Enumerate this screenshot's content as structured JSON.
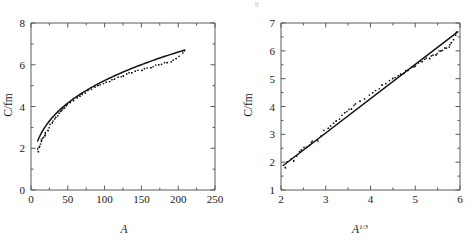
{
  "figure": {
    "panels": 2,
    "ink_color": "#111111",
    "axis_color": "#5a5a5a",
    "background": "#ffffff"
  },
  "chart_data": [
    {
      "type": "scatter",
      "panel": "left",
      "title": "",
      "xlabel": "A",
      "ylabel": "C/fm",
      "xlim": [
        0,
        250
      ],
      "ylim": [
        0,
        8
      ],
      "xticks": [
        0,
        50,
        100,
        150,
        200,
        250
      ],
      "yticks": [
        0,
        2,
        4,
        6,
        8
      ],
      "xtick_labels": [
        "0",
        "50",
        "100",
        "150",
        "200",
        "250"
      ],
      "ytick_labels": [
        "0",
        "2",
        "4",
        "6",
        "8"
      ],
      "grid": false,
      "legend": null,
      "series": [
        {
          "name": "C vs A",
          "marker": "dot",
          "x": [
            9,
            10,
            11,
            12,
            13,
            14,
            15,
            16,
            17,
            18,
            19,
            20,
            22,
            24,
            26,
            28,
            30,
            32,
            34,
            36,
            38,
            40,
            42,
            44,
            46,
            48,
            50,
            54,
            58,
            62,
            66,
            70,
            74,
            78,
            82,
            86,
            90,
            94,
            98,
            102,
            106,
            110,
            114,
            118,
            122,
            126,
            130,
            134,
            138,
            142,
            146,
            150,
            154,
            158,
            162,
            166,
            170,
            174,
            178,
            182,
            186,
            190,
            194,
            198,
            202,
            206,
            209
          ],
          "y": [
            1.85,
            1.95,
            2.02,
            2.1,
            2.2,
            2.3,
            2.38,
            2.45,
            2.52,
            2.6,
            2.68,
            2.75,
            2.88,
            3.0,
            3.12,
            3.22,
            3.32,
            3.42,
            3.5,
            3.58,
            3.66,
            3.74,
            3.82,
            3.88,
            3.95,
            4.01,
            4.07,
            4.19,
            4.3,
            4.4,
            4.5,
            4.59,
            4.67,
            4.75,
            4.83,
            4.9,
            4.97,
            5.04,
            5.1,
            5.16,
            5.22,
            5.28,
            5.34,
            5.39,
            5.44,
            5.49,
            5.54,
            5.59,
            5.63,
            5.68,
            5.72,
            5.76,
            5.8,
            5.84,
            5.88,
            5.92,
            5.96,
            6.0,
            6.04,
            6.08,
            6.12,
            6.16,
            6.2,
            6.29,
            6.42,
            6.58,
            6.7
          ]
        }
      ],
      "fit": {
        "name": "cube-root fit",
        "form": "C = r0 * A^(1/3)",
        "r0": 1.13
      }
    },
    {
      "type": "scatter",
      "panel": "right",
      "title": "",
      "xlabel": "A^1/3",
      "xlabel_base": "A",
      "xlabel_exponent": "1/3",
      "ylabel": "C/fm",
      "xlim": [
        2,
        6
      ],
      "ylim": [
        1,
        7
      ],
      "xticks": [
        2,
        3,
        4,
        5,
        6
      ],
      "yticks": [
        1,
        2,
        3,
        4,
        5,
        6,
        7
      ],
      "xtick_labels": [
        "2",
        "3",
        "4",
        "5",
        "6"
      ],
      "ytick_labels": [
        "1",
        "2",
        "3",
        "4",
        "5",
        "6",
        "7"
      ],
      "grid": false,
      "legend": null,
      "series": [
        {
          "name": "C vs A^(1/3)",
          "marker": "dot",
          "x": [
            2.08,
            2.15,
            2.22,
            2.29,
            2.35,
            2.41,
            2.47,
            2.52,
            2.57,
            2.62,
            2.67,
            2.71,
            2.8,
            2.88,
            2.96,
            3.04,
            3.11,
            3.17,
            3.24,
            3.3,
            3.36,
            3.42,
            3.48,
            3.53,
            3.58,
            3.63,
            3.68,
            3.78,
            3.87,
            3.96,
            4.04,
            4.12,
            4.2,
            4.27,
            4.34,
            4.41,
            4.48,
            4.55,
            4.61,
            4.67,
            4.73,
            4.79,
            4.85,
            4.91,
            4.96,
            5.01,
            5.07,
            5.12,
            5.17,
            5.22,
            5.26,
            5.31,
            5.36,
            5.4,
            5.45,
            5.49,
            5.54,
            5.58,
            5.62,
            5.67,
            5.71,
            5.75,
            5.79,
            5.82,
            5.87,
            5.9,
            5.93
          ],
          "y": [
            1.85,
            1.95,
            2.02,
            2.1,
            2.2,
            2.3,
            2.38,
            2.45,
            2.52,
            2.6,
            2.68,
            2.75,
            2.88,
            3.0,
            3.12,
            3.22,
            3.32,
            3.42,
            3.5,
            3.58,
            3.66,
            3.74,
            3.82,
            3.88,
            3.95,
            4.01,
            4.07,
            4.19,
            4.3,
            4.4,
            4.5,
            4.59,
            4.67,
            4.75,
            4.83,
            4.9,
            4.97,
            5.04,
            5.1,
            5.16,
            5.22,
            5.28,
            5.34,
            5.39,
            5.44,
            5.49,
            5.54,
            5.59,
            5.63,
            5.68,
            5.72,
            5.76,
            5.8,
            5.84,
            5.88,
            5.92,
            5.96,
            6.0,
            6.04,
            6.08,
            6.12,
            6.16,
            6.2,
            6.29,
            6.42,
            6.58,
            6.7
          ]
        }
      ],
      "fit": {
        "name": "linear fit",
        "form": "C = m * A^(1/3) + b",
        "slope": 1.23,
        "intercept": -0.64,
        "x_start": 2.05,
        "x_end": 5.95,
        "y_start": 1.88,
        "y_end": 6.68
      }
    }
  ]
}
